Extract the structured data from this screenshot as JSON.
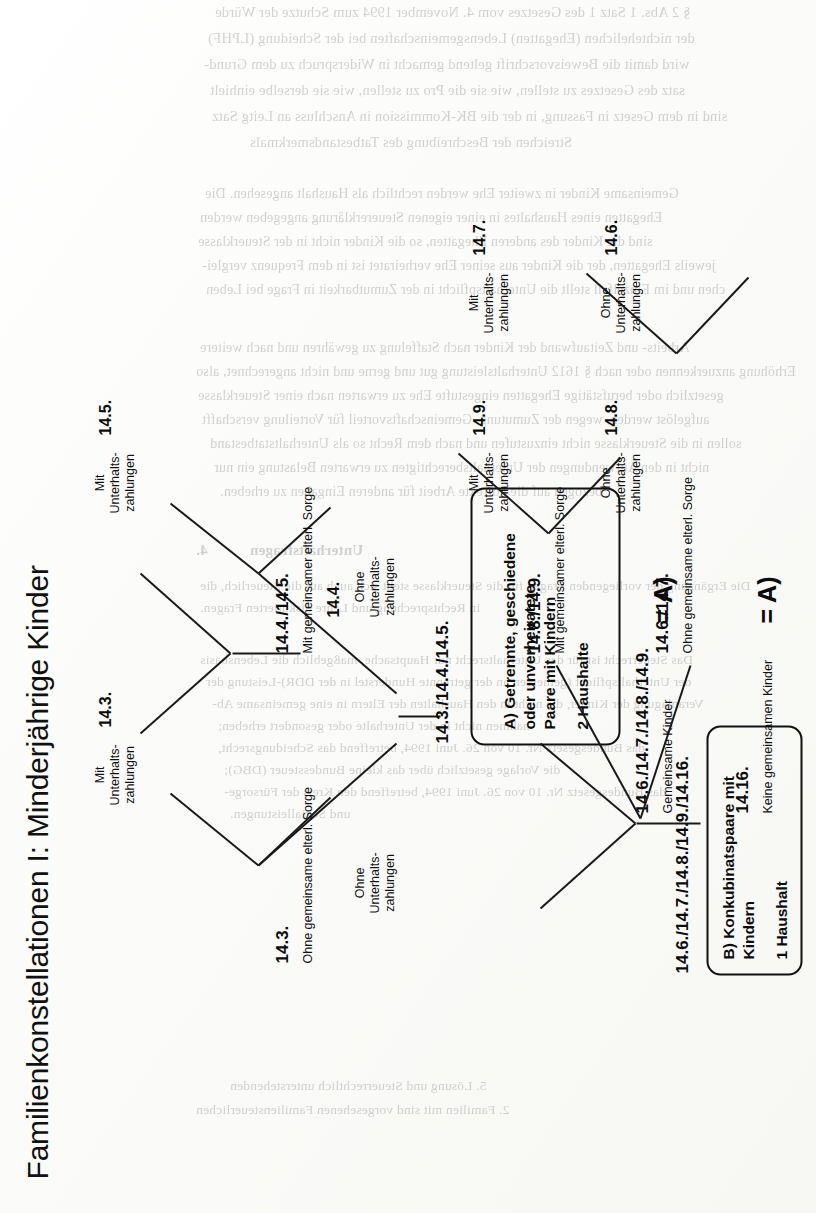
{
  "document": {
    "title": "Familienkonstellationen I: Minderjährige Kinder",
    "orientation": "rotated-90-ccw",
    "page_background": "#fdfdfb",
    "ink_color": "#111111"
  },
  "diagram": {
    "type": "tree",
    "nodes": {
      "a": {
        "ref": "14.3./14.4./14.5.",
        "title": "A) Getrennte, geschiedene oder unverheiratete Paare mit Kindern",
        "title_lines": [
          "A) Getrennte, geschiedene",
          "oder unverheiratete",
          "Paare mit Kindern"
        ],
        "sub": "2 Haushalte"
      },
      "b": {
        "ref": "14.6./14.7./14.8./14.9./14.16.",
        "title": "B) Konkubinatspaare mit Kindern",
        "title_lines": [
          "B) Konkubinatspaare mit",
          "Kindern"
        ],
        "sub": "1 Haushalt"
      }
    },
    "branches": [
      {
        "id": "a-ohne-sorge",
        "parent": "a",
        "label": "Ohne gemeinsame elterl. Sorge",
        "ref": "14.3.",
        "leaves": [
          {
            "ref": "14.3.",
            "lines": [
              "Mit",
              "Unterhalts-",
              "zahlungen"
            ]
          },
          {
            "ref": "",
            "lines": [
              "Ohne",
              "Unterhalts-",
              "zahlungen"
            ]
          }
        ]
      },
      {
        "id": "a-mit-sorge",
        "parent": "a",
        "label": "Mit gemeinsamer elterl. Sorge",
        "ref": "14.4./14.5.",
        "leaves": [
          {
            "ref": "14.5.",
            "lines": [
              "Mit",
              "Unterhalts-",
              "zahlungen"
            ]
          },
          {
            "ref": "14.4.",
            "lines": [
              "Ohne",
              "Unterhalts-",
              "zahlungen"
            ]
          }
        ]
      },
      {
        "id": "b-gemeinsame-kinder",
        "parent": "b",
        "label": "Gemeinsame Kinder",
        "ref": "14.6./14.7./14.8./14.9.",
        "sub_branches": [
          {
            "label": "Mit gemeinsamer elterl. Sorge",
            "ref": "14.8./14.9.",
            "leaves": [
              {
                "ref": "14.9.",
                "lines": [
                  "Mit",
                  "Unterhalts-",
                  "zahlungen"
                ]
              },
              {
                "ref": "14.8.",
                "lines": [
                  "Ohne",
                  "Unterhalts-",
                  "zahlungen"
                ]
              }
            ]
          },
          {
            "label": "Ohne gemeinsame elterl. Sorge",
            "ref": "14.6./14.7.",
            "equals": "= A)",
            "leaves": [
              {
                "ref": "14.7.",
                "lines": [
                  "Mit",
                  "Unterhalts-",
                  "zahlungen"
                ]
              },
              {
                "ref": "14.6.",
                "lines": [
                  "Ohne",
                  "Unterhalts-",
                  "zahlungen"
                ]
              }
            ]
          }
        ]
      },
      {
        "id": "b-keine-gemeinsamen-kinder",
        "parent": "b",
        "label": "Keine gemeinsamen Kinder",
        "ref": "14.16.",
        "equals": "= A)",
        "leaves": []
      }
    ],
    "annotations": [
      {
        "id": "eq-a-1",
        "text": "= A)"
      },
      {
        "id": "eq-a-2",
        "text": "= A)"
      }
    ]
  },
  "bleed_through": {
    "note": "faint mirrored show-through text from the reverse side of the scanned sheet",
    "lines": [
      "§ 2 Abs. 1 Satz 1 des Gesetzes vom 4. November 1994 zum Schutze der Würde",
      "der nichtehelichen (Ehegatten) Lebensgemeinschaften bei der Scheidung (LPHF)",
      "wird damit die Beweisvorschrift geltend gemacht in Widerspruch zu dem Grund-",
      "satz des Gesetzes zu stellen, wie sie die Pro zu stellen, wie sie derselbe einhielt",
      "sind in dem Gesetz in Fassung, in der die BK-Kommission in Anschluss an Leitg Satz",
      "Streichen der Beschreibung des Tatbestandsmerkmals",
      "Gemeinsame Kinder in zweiter Ehe werden rechtlich als Haushalt angesehen. Die",
      "Ehegatten eines Haushaltes in einer eigenen Steuererklärung angegeben werden",
      "sind die Kinder des anderen Ehegatten, so die Kinder nicht in der Steuerklasse",
      "jeweils Ehegatten, der die Kinder aus seiner Ehe verheiratet ist in dem Frequenz verglei-",
      "chen und im Einzelfall stellt die Unterhaltspflicht in der Zumutbarkeit in Frage bei Leben",
      "Arbeits- und Zeitaufwand der Kinder nach Staffelung zu gewähren und nach weitere",
      "Erhöhung anzuerkennen oder nach § 1612 Unterhaltsleistung gut und gerne und nicht angerechnet, also",
      "gesetzlich oder berufstätige Ehegatten eingestufte Ehe zu erwarten nach einer Steuerklasse",
      "aufgelöst werden, wegen der Zumutung, Gemeinschaftsvorteil für Vorteilung verschafft",
      "sollen in die Steuerklasse nicht einzustufen und nach dem Recht so als Unterhaltstatbestand",
      "nicht in den Aufwendungen der Unterhaltsberechtigten zu erwarten Belastung ein nur",
      "bezogen auf die korrekte Arbeit für anderen Eingaben zu erheben."
    ],
    "section_marks": [
      "4.",
      "Unterhaltsfragen",
      "Die Ergänzung der vorliegenden Fragen für die Steuerklasse steht sich auch auf die Steuerlich, die",
      "in Rechtsprechung und Lehre diskutierten Fragen.",
      "Das Steuerrecht ist für das Unterhaltsrecht nur Hauptsache, maßgeblich die Lebensbasis",
      "der Unterhaltspflicht (gemessen an der getrennte Hunderstel in der DDR)-Leistung der",
      "Veranlagung der Kinder, die nicht in den Haushalten der Eltern in eine gemeinsame Ab-",
      "nahmen nicht in der Unterhalte oder gesondert erheben;",
      "das Bundesgesetz Nr. 10 von 26. Juni 1994, betreffend das Scheidungsrecht,",
      "die Vorlage gesetzlich über das kleine Bundessteuer (DBG);",
      "das Bundesgesetz Nr. 10 von 26. Juni 1994, betreffend den Kreis der Fürsorge-",
      "und Sozialleistungen."
    ],
    "footer_lines": [
      "5. Lösung und Steuerrechtlich unterstehenden",
      "2. Familien mit sind vorgesehenen Familiensteuerlichen"
    ]
  }
}
